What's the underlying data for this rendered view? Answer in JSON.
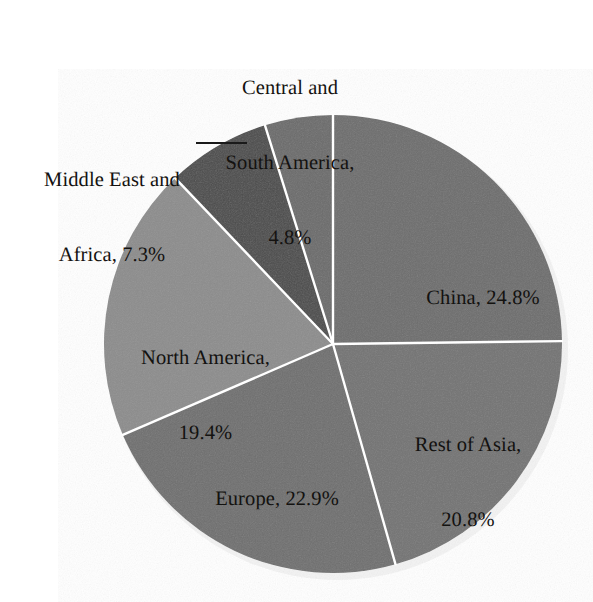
{
  "chart_data": {
    "type": "pie",
    "title": "",
    "subtitle": "",
    "xlabel": "",
    "ylabel": "",
    "legend_position": "none",
    "grid": false,
    "units": "percent",
    "start_angle_deg": -90,
    "direction": "clockwise",
    "categories": [
      "China",
      "Rest of Asia",
      "Europe",
      "North America",
      "Middle East and Africa",
      "Central and South America"
    ],
    "values": [
      24.8,
      20.8,
      22.9,
      19.4,
      7.3,
      4.8
    ],
    "slices": [
      {
        "name": "China",
        "value": 24.8,
        "value_text": "24.8%",
        "label_text": "China, 24.8%",
        "label_lines": [
          "China, 24.8%"
        ],
        "color": "#6d6d6d",
        "label_placement": "inside",
        "start_deg": -90.0,
        "end_deg": -0.72
      },
      {
        "name": "Rest of Asia",
        "value": 20.8,
        "value_text": "20.8%",
        "label_text": "Rest of Asia, 20.8%",
        "label_lines": [
          "Rest of Asia,",
          "20.8%"
        ],
        "color": "#737373",
        "label_placement": "inside",
        "start_deg": -0.72,
        "end_deg": 74.16
      },
      {
        "name": "Europe",
        "value": 22.9,
        "value_text": "22.9%",
        "label_text": "Europe, 22.9%",
        "label_lines": [
          "Europe, 22.9%"
        ],
        "color": "#6f6f6f",
        "label_placement": "inside",
        "start_deg": 74.16,
        "end_deg": 156.6
      },
      {
        "name": "North America",
        "value": 19.4,
        "value_text": "19.4%",
        "label_text": "North America, 19.4%",
        "label_lines": [
          "North America,",
          "19.4%"
        ],
        "color": "#8c8c8c",
        "label_placement": "inside",
        "start_deg": 156.6,
        "end_deg": 226.44
      },
      {
        "name": "Middle East and Africa",
        "value": 7.3,
        "value_text": "7.3%",
        "label_text": "Middle East and Africa, 7.3%",
        "label_lines": [
          "Middle East and",
          "Africa, 7.3%"
        ],
        "color": "#4b4b4b",
        "label_placement": "outside",
        "leader_line": true,
        "start_deg": 226.44,
        "end_deg": 252.72
      },
      {
        "name": "Central and South America",
        "value": 4.8,
        "value_text": "4.8%",
        "label_text": "Central and South America, 4.8%",
        "label_lines": [
          "Central and",
          "South America,",
          "4.8%"
        ],
        "color": "#6b6b6b",
        "label_placement": "outside",
        "leader_line": true,
        "start_deg": 252.72,
        "end_deg": 270.0
      }
    ],
    "geometry": {
      "center_x": 333,
      "center_y": 344,
      "radius": 229,
      "slice_border_color": "#ffffff",
      "slice_border_width": 2.4,
      "background": "#ffffff"
    }
  },
  "labels": {
    "china": {
      "line1": "China, 24.8%"
    },
    "rest_of_asia": {
      "line1": "Rest of Asia,",
      "line2": "20.8%"
    },
    "europe": {
      "line1": "Europe, 22.9%"
    },
    "north_america": {
      "line1": "North America,",
      "line2": "19.4%"
    },
    "middle_east_africa": {
      "line1": "Middle East and",
      "line2": "Africa, 7.3%"
    },
    "central_south_america": {
      "line1": "Central and",
      "line2": "South America,",
      "line3": "4.8%"
    }
  }
}
